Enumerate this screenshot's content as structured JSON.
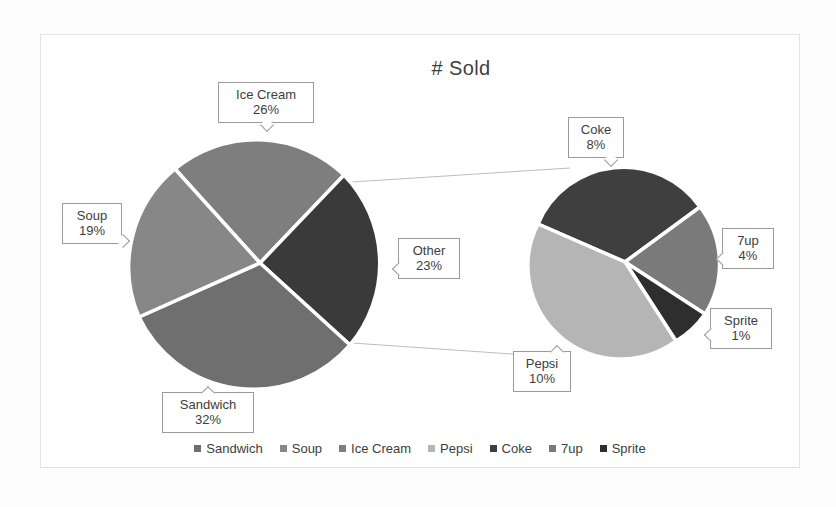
{
  "chart_data": {
    "type": "pie",
    "title": "# Sold",
    "subtype": "pie-of-pie",
    "categories": [
      "Sandwich",
      "Soup",
      "Ice Cream",
      "Pepsi",
      "Coke",
      "7up",
      "Sprite"
    ],
    "values": [
      32,
      19,
      26,
      10,
      8,
      4,
      1
    ],
    "value_labels": [
      "32%",
      "19%",
      "26%",
      "10%",
      "8%",
      "4%",
      "1%"
    ],
    "main_pie": {
      "slices": [
        {
          "label": "Sandwich",
          "value": 32,
          "value_label": "32%",
          "color": "#6f6f6f"
        },
        {
          "label": "Soup",
          "value": 19,
          "value_label": "19%",
          "color": "#878787"
        },
        {
          "label": "Ice Cream",
          "value": 26,
          "value_label": "26%",
          "color": "#7e7e7e"
        },
        {
          "label": "Other",
          "value": 23,
          "value_label": "23%",
          "color": "#3a3a3a"
        }
      ]
    },
    "secondary_pie": {
      "slices": [
        {
          "label": "Pepsi",
          "value": 10,
          "value_label": "10%",
          "color": "#b5b5b5"
        },
        {
          "label": "Coke",
          "value": 8,
          "value_label": "8%",
          "color": "#3f3f3f"
        },
        {
          "label": "7up",
          "value": 4,
          "value_label": "4%",
          "color": "#7a7a7a"
        },
        {
          "label": "Sprite",
          "value": 1,
          "value_label": "1%",
          "color": "#2e2e2e"
        }
      ]
    },
    "legend": {
      "position": "bottom",
      "entries": [
        {
          "label": "Sandwich",
          "color": "#6f6f6f"
        },
        {
          "label": "Soup",
          "color": "#878787"
        },
        {
          "label": "Ice Cream",
          "color": "#7e7e7e"
        },
        {
          "label": "Pepsi",
          "color": "#b5b5b5"
        },
        {
          "label": "Coke",
          "color": "#3f3f3f"
        },
        {
          "label": "7up",
          "color": "#7a7a7a"
        },
        {
          "label": "Sprite",
          "color": "#2e2e2e"
        }
      ]
    },
    "grid": false
  },
  "labels": {
    "ice_cream": {
      "name": "Ice Cream",
      "value": "26%"
    },
    "soup": {
      "name": "Soup",
      "value": "19%"
    },
    "sandwich": {
      "name": "Sandwich",
      "value": "32%"
    },
    "other": {
      "name": "Other",
      "value": "23%"
    },
    "coke": {
      "name": "Coke",
      "value": "8%"
    },
    "sevenup": {
      "name": "7up",
      "value": "4%"
    },
    "sprite": {
      "name": "Sprite",
      "value": "1%"
    },
    "pepsi": {
      "name": "Pepsi",
      "value": "10%"
    }
  }
}
